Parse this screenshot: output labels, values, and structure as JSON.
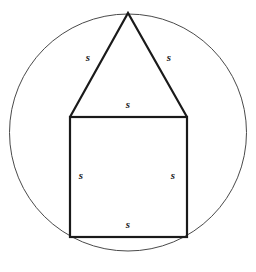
{
  "figure": {
    "type": "geometry-diagram",
    "canvas": {
      "width": 256,
      "height": 272,
      "background": "#ffffff"
    },
    "colors": {
      "circle_stroke": "#4a4a4a",
      "shape_stroke": "#1a1a1a",
      "fill": "none",
      "label_color": "#1c1c1c"
    },
    "circle": {
      "name": "circumscribed-circle",
      "cx": 128,
      "cy": 132.5,
      "r": 118.5,
      "stroke_width": 1
    },
    "square": {
      "name": "square",
      "x": 70,
      "y": 117,
      "width": 117,
      "height": 120,
      "stroke_width": 2.2
    },
    "triangle": {
      "name": "triangle",
      "apex_x": 128,
      "apex_y": 13,
      "left_x": 70,
      "left_y": 117,
      "right_x": 187,
      "right_y": 117,
      "stroke_width": 2.2
    },
    "labels": [
      {
        "name": "label-triangle-left-side",
        "text": "s",
        "x": 88,
        "y": 57
      },
      {
        "name": "label-triangle-right-side",
        "text": "s",
        "x": 169,
        "y": 57
      },
      {
        "name": "label-square-top-side",
        "text": "s",
        "x": 128,
        "y": 104
      },
      {
        "name": "label-square-left-side",
        "text": "s",
        "x": 81,
        "y": 175
      },
      {
        "name": "label-square-right-side",
        "text": "s",
        "x": 173,
        "y": 175
      },
      {
        "name": "label-square-bottom-side",
        "text": "s",
        "x": 128,
        "y": 224
      }
    ]
  }
}
